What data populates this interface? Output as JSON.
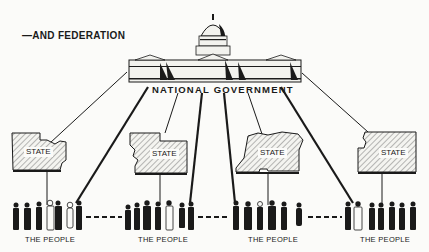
{
  "diagram": {
    "title": "—AND FEDERATION",
    "central_node": {
      "label": "NATIONAL GOVERNMENT",
      "icon": "capitol-building-icon"
    },
    "states": [
      {
        "label": "STATE"
      },
      {
        "label": "STATE"
      },
      {
        "label": "STATE"
      },
      {
        "label": "STATE"
      }
    ],
    "people_groups": [
      {
        "label": "THE PEOPLE"
      },
      {
        "label": "THE PEOPLE"
      },
      {
        "label": "THE PEOPLE"
      },
      {
        "label": "THE PEOPLE"
      }
    ],
    "connections": "National government connects directly to each state (thin lines) and directly to each group of the people (thick lines); each state connects to its people; groups of people are linked by dashed lines.",
    "colors": {
      "ink": "#1a1a1a",
      "paper": "#fbfbf9"
    }
  }
}
